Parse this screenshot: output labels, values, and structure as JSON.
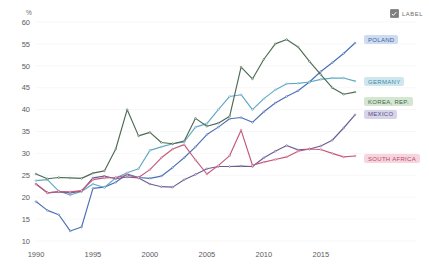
{
  "controls": {
    "label_toggle": {
      "text": "LABEL",
      "checked": true,
      "icon": "checkbox-checked-icon"
    }
  },
  "chart_data": {
    "type": "line",
    "title": "",
    "subtitle": "",
    "xlabel": "",
    "ylabel": "%",
    "unit": "%",
    "xlim": [
      1990,
      2018
    ],
    "ylim": [
      10,
      60
    ],
    "ytick_step": 5,
    "yticks": [
      10,
      15,
      20,
      25,
      30,
      35,
      40,
      45,
      50,
      55,
      60
    ],
    "xticks": [
      1990,
      1995,
      2000,
      2005,
      2010,
      2015
    ],
    "grid": true,
    "grid_color": "#f4f4f6",
    "legend_position": "right-inline-labels",
    "markers": true,
    "x": [
      1990,
      1991,
      1992,
      1993,
      1994,
      1995,
      1996,
      1997,
      1998,
      1999,
      2000,
      2001,
      2002,
      2003,
      2004,
      2005,
      2006,
      2007,
      2008,
      2009,
      2010,
      2011,
      2012,
      2013,
      2014,
      2015,
      2016,
      2017,
      2018
    ],
    "series": [
      {
        "name": "POLAND",
        "color": "#4a6fb5",
        "label_bg": "#cddcf0",
        "label_color": "#3d5f9e",
        "values": [
          19.0,
          17.0,
          16.0,
          12.3,
          13.2,
          22.0,
          22.3,
          23.4,
          25.3,
          24.5,
          24.3,
          24.8,
          26.8,
          29.0,
          31.5,
          34.3,
          36.0,
          37.9,
          38.2,
          37.1,
          39.5,
          41.5,
          43.0,
          44.3,
          46.3,
          48.7,
          50.7,
          52.8,
          55.2
        ]
      },
      {
        "name": "GERMANY",
        "color": "#5fa8c4",
        "label_bg": "#cfe6ee",
        "label_color": "#3e8ba8",
        "values": [
          23.8,
          24.0,
          21.4,
          20.5,
          21.3,
          23.0,
          22.2,
          24.4,
          25.6,
          26.5,
          30.7,
          31.5,
          32.2,
          32.6,
          36.0,
          36.8,
          40.0,
          43.0,
          43.4,
          40.0,
          42.5,
          44.5,
          45.9,
          46.0,
          46.3,
          46.9,
          47.2,
          47.2,
          46.5
        ]
      },
      {
        "name": "KOREA, REP.",
        "color": "#4c6b52",
        "label_bg": "#d5e6d2",
        "label_color": "#43684c",
        "values": [
          25.3,
          24.2,
          24.5,
          24.4,
          24.3,
          25.5,
          26.0,
          31.0,
          40.0,
          34.0,
          34.8,
          32.5,
          32.2,
          32.8,
          38.0,
          36.2,
          36.9,
          38.5,
          49.7,
          47.0,
          51.5,
          55.0,
          56.0,
          54.3,
          51.0,
          48.0,
          45.0,
          43.5,
          44.0
        ]
      },
      {
        "name": "MEXICO",
        "color": "#6b5d94",
        "label_bg": "#d6d4e8",
        "label_color": "#5c5188",
        "values": [
          23.0,
          21.0,
          21.2,
          21.0,
          21.4,
          24.4,
          24.8,
          24.2,
          24.6,
          24.4,
          23.0,
          22.4,
          22.3,
          24.0,
          25.2,
          26.5,
          27.0,
          27.0,
          27.1,
          27.0,
          29.0,
          30.5,
          31.8,
          30.8,
          31.0,
          31.7,
          33.0,
          35.8,
          38.8
        ]
      },
      {
        "name": "SOUTH AFRICA",
        "color": "#c4577a",
        "label_bg": "#f6d5dd",
        "label_color": "#b9496d",
        "values": [
          23.0,
          21.0,
          21.3,
          21.2,
          21.5,
          24.0,
          24.4,
          24.5,
          25.0,
          24.5,
          26.3,
          29.0,
          31.0,
          32.0,
          28.5,
          25.3,
          27.2,
          29.5,
          35.3,
          27.3,
          28.0,
          28.6,
          29.2,
          30.5,
          31.0,
          30.9,
          30.0,
          29.2,
          29.4
        ]
      }
    ]
  }
}
